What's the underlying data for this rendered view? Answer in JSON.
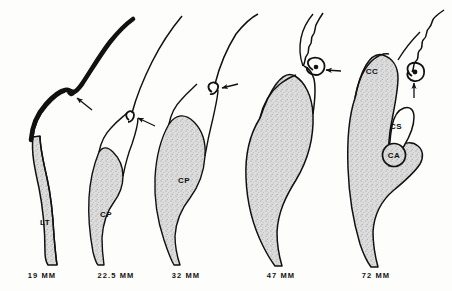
{
  "figure": {
    "background_color": "#fdfdfb",
    "ink_color": "#111111",
    "fill_color": "#d9d9d9",
    "stipple_color": "#8e8e8e",
    "stage_count": 5
  },
  "stages": [
    {
      "id": "stage-19mm",
      "caption": "19 MM",
      "caption_x": 42,
      "caption_y": 271,
      "labels": [
        {
          "name": "LT",
          "text": "LT",
          "x": 45,
          "y": 222
        }
      ],
      "arrows": [
        {
          "name": "arrow-notch",
          "x": 78,
          "y": 100
        }
      ],
      "features": {
        "thick_dorsal_band": true,
        "shaded_body": true,
        "notch": true
      }
    },
    {
      "id": "stage-22-5mm",
      "caption": "22.5 MM",
      "caption_x": 116,
      "caption_y": 271,
      "labels": [
        {
          "name": "CP",
          "text": "CP",
          "x": 106,
          "y": 214
        }
      ],
      "arrows": [
        {
          "name": "arrow-primordium",
          "x": 140,
          "y": 128
        }
      ],
      "features": {
        "thick_dorsal_band": false,
        "shaded_body": true,
        "hook": true
      }
    },
    {
      "id": "stage-32mm",
      "caption": "32 MM",
      "caption_x": 186,
      "caption_y": 271,
      "labels": [
        {
          "name": "CP",
          "text": "CP",
          "x": 184,
          "y": 180
        }
      ],
      "arrows": [
        {
          "name": "arrow-primordium",
          "x": 228,
          "y": 90
        }
      ],
      "features": {
        "thick_dorsal_band": false,
        "shaded_body": true,
        "hook": true
      }
    },
    {
      "id": "stage-47mm",
      "caption": "47 MM",
      "caption_x": 281,
      "caption_y": 271,
      "labels": [],
      "arrows": [
        {
          "name": "arrow-commissure",
          "x": 338,
          "y": 71
        }
      ],
      "features": {
        "thick_dorsal_band": false,
        "shaded_body": true,
        "coil": true
      }
    },
    {
      "id": "stage-72mm",
      "caption": "72 MM",
      "caption_x": 376,
      "caption_y": 271,
      "labels": [
        {
          "name": "CC",
          "text": "CC",
          "x": 372,
          "y": 71
        },
        {
          "name": "CS",
          "text": "CS",
          "x": 396,
          "y": 126
        },
        {
          "name": "CA",
          "text": "CA",
          "x": 394,
          "y": 155
        }
      ],
      "arrows": [
        {
          "name": "arrow-fornix",
          "x": 414,
          "y": 85
        }
      ],
      "features": {
        "thick_dorsal_band": false,
        "shaded_body": true,
        "coil": true,
        "cavum": true,
        "anterior_commissure_circle": true
      }
    }
  ],
  "legend_keys": [
    {
      "abbr": "LT",
      "meaning": "lamina terminalis"
    },
    {
      "abbr": "CP",
      "meaning": "commissural plate"
    },
    {
      "abbr": "CC",
      "meaning": "corpus callosum"
    },
    {
      "abbr": "CS",
      "meaning": "cavum septi"
    },
    {
      "abbr": "CA",
      "meaning": "anterior commissure"
    }
  ]
}
